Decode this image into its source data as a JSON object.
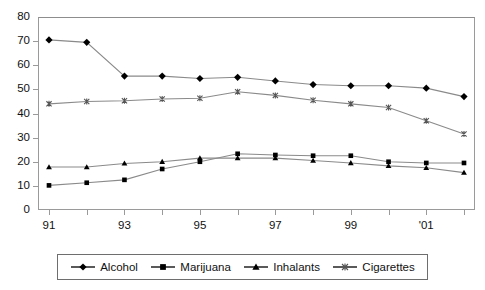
{
  "chart_data": {
    "type": "line",
    "title": "",
    "subtitle": "",
    "xlabel": "",
    "ylabel": "",
    "xlim": [
      1991,
      2002
    ],
    "ylim": [
      0,
      80
    ],
    "grid": false,
    "legend_position": "bottom",
    "x": [
      1991,
      1992,
      1993,
      1994,
      1995,
      1996,
      1997,
      1998,
      1999,
      2000,
      2001,
      2002
    ],
    "categories": [
      "91",
      "92",
      "93",
      "94",
      "95",
      "96",
      "97",
      "98",
      "99",
      "00",
      "'01",
      "02"
    ],
    "x_tick_labels": [
      "91",
      "",
      "93",
      "",
      "95",
      "",
      "97",
      "",
      "99",
      "",
      "'01",
      ""
    ],
    "y_ticks": [
      0,
      10,
      20,
      30,
      40,
      50,
      60,
      70,
      80
    ],
    "series": [
      {
        "name": "Alcohol",
        "marker": "diamond",
        "values": [
          70.5,
          69.5,
          55.5,
          55.5,
          54.5,
          55,
          53.5,
          52,
          51.5,
          51.5,
          50.5,
          47
        ]
      },
      {
        "name": "Marijuana",
        "marker": "square",
        "values": [
          10.2,
          11.3,
          12.5,
          17,
          20,
          23.3,
          22.8,
          22.5,
          22.5,
          20,
          19.5,
          19.5
        ]
      },
      {
        "name": "Inhalants",
        "marker": "triangle",
        "values": [
          17.8,
          17.8,
          19.3,
          20,
          21.5,
          21.5,
          21.5,
          20.5,
          19.5,
          18.3,
          17.5,
          15.5
        ]
      },
      {
        "name": "Cigarettes",
        "marker": "x",
        "values": [
          44,
          45,
          45.3,
          46,
          46.3,
          49,
          47.5,
          45.5,
          44,
          42.5,
          37,
          31.5
        ]
      }
    ]
  },
  "legend": {
    "items": [
      {
        "label": "Alcohol",
        "marker": "diamond"
      },
      {
        "label": "Marijuana",
        "marker": "square"
      },
      {
        "label": "Inhalants",
        "marker": "triangle"
      },
      {
        "label": "Cigarettes",
        "marker": "x"
      }
    ]
  }
}
